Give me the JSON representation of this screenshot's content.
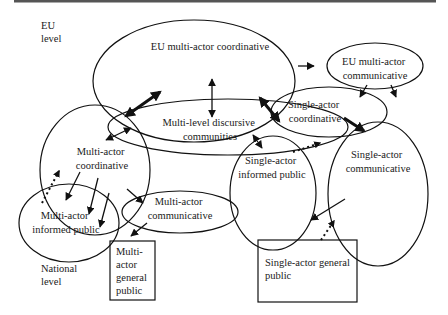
{
  "diagram": {
    "top_rule_color": "#555555",
    "level_labels": {
      "eu": [
        "EU",
        "level"
      ],
      "national": [
        "National",
        "level"
      ]
    },
    "nodes": {
      "eu_multi_actor_coordinative": {
        "lines": [
          "EU multi-actor coordinative"
        ],
        "shape": "ellipse"
      },
      "eu_multi_actor_communicative": {
        "lines": [
          "EU multi-actor",
          "communicative"
        ],
        "shape": "ellipse"
      },
      "multi_level_discursive_communities": {
        "lines": [
          "Multi-level discursive",
          "communities"
        ],
        "shape": "ellipse"
      },
      "single_actor_coordinative": {
        "lines": [
          "Single-actor",
          "coordinative"
        ],
        "shape": "ellipse"
      },
      "multi_actor_coordinative": {
        "lines": [
          "Multi-actor",
          "coordinative"
        ],
        "shape": "ellipse"
      },
      "single_actor_informed_public": {
        "lines": [
          "Single-actor",
          "informed public"
        ],
        "shape": "ellipse"
      },
      "single_actor_communicative": {
        "lines": [
          "Single-actor",
          "communicative"
        ],
        "shape": "ellipse"
      },
      "multi_actor_informed_public": {
        "lines": [
          "Multi-actor",
          "informed public"
        ],
        "shape": "ellipse"
      },
      "multi_actor_communicative": {
        "lines": [
          "Multi-actor",
          "communicative"
        ],
        "shape": "ellipse"
      },
      "multi_actor_general_public": {
        "lines": [
          "Multi-",
          "actor",
          "general",
          "public"
        ],
        "shape": "box"
      },
      "single_actor_general_public": {
        "lines": [
          "Single-actor general",
          "public"
        ],
        "shape": "box"
      }
    },
    "edges": [
      {
        "from": "eu_multi_actor_coordinative",
        "to": "multi_level_discursive_communities",
        "style": "thin",
        "direction": "both"
      },
      {
        "from": "multi_actor_coordinative",
        "to": "eu_multi_actor_coordinative",
        "style": "thick",
        "direction": "both"
      },
      {
        "from": "multi_actor_coordinative",
        "to": "multi_level_discursive_communities",
        "style": "thin",
        "direction": "both"
      },
      {
        "from": "single_actor_coordinative",
        "to": "multi_level_discursive_communities",
        "style": "thick",
        "direction": "both"
      },
      {
        "from": "external",
        "to": "eu_multi_actor_communicative",
        "style": "thin",
        "direction": "forward"
      },
      {
        "from": "eu_multi_actor_communicative",
        "to": "single_actor_coordinative",
        "style": "thin",
        "direction": "forward"
      },
      {
        "from": "eu_multi_actor_communicative",
        "to": "single_actor_communicative",
        "style": "thin",
        "direction": "forward"
      },
      {
        "from": "single_actor_coordinative",
        "to": "single_actor_communicative",
        "style": "thick",
        "direction": "forward"
      },
      {
        "from": "single_actor_informed_public",
        "to": "single_actor_coordinative",
        "style": "dotted",
        "direction": "forward"
      },
      {
        "from": "multi_level_discursive_communities",
        "to": "single_actor_informed_public",
        "style": "thin",
        "direction": "both"
      },
      {
        "from": "multi_actor_coordinative",
        "to": "multi_actor_informed_public",
        "style": "thin",
        "direction": "forward",
        "count": 3
      },
      {
        "from": "multi_actor_informed_public",
        "to": "multi_actor_coordinative",
        "style": "dotted",
        "direction": "forward"
      },
      {
        "from": "multi_actor_coordinative",
        "to": "multi_actor_communicative",
        "style": "thin",
        "direction": "forward"
      },
      {
        "from": "multi_actor_communicative",
        "to": "multi_actor_general_public",
        "style": "thin",
        "direction": "forward"
      },
      {
        "from": "single_actor_communicative",
        "to": "single_actor_informed_public",
        "style": "thin",
        "direction": "forward"
      },
      {
        "from": "single_actor_general_public",
        "to": "single_actor_communicative",
        "style": "dotted",
        "direction": "forward"
      }
    ]
  }
}
